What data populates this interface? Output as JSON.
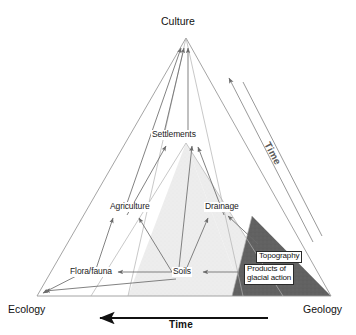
{
  "figure": {
    "title_fragment": "",
    "type": "ternary-conceptual-diagram",
    "corners": {
      "top": "Culture",
      "bottom_left": "Ecology",
      "bottom_right": "Geology"
    },
    "nodes": [
      {
        "id": "settlements",
        "label": "Settlements"
      },
      {
        "id": "agriculture",
        "label": "Agriculture"
      },
      {
        "id": "drainage",
        "label": "Drainage"
      },
      {
        "id": "flora_fauna",
        "label": "Flora/fauna"
      },
      {
        "id": "soils",
        "label": "Soils"
      }
    ],
    "boxed_nodes": [
      {
        "id": "topography",
        "label": "Topography"
      },
      {
        "id": "glacial",
        "label": "Products of\nglacial action"
      }
    ],
    "axes": [
      {
        "id": "bottom-time",
        "label": "Time",
        "direction": "right-to-left"
      },
      {
        "id": "diagonal-time",
        "label": "Time",
        "direction": "lower-right-to-upper-left"
      }
    ],
    "shading": {
      "light_region_color": "#ededed",
      "dark_region_color": "#5e5e5e",
      "outline_color": "#8a8a8a",
      "arrow_color": "#6b6b6b",
      "axis_color": "#111111"
    }
  }
}
